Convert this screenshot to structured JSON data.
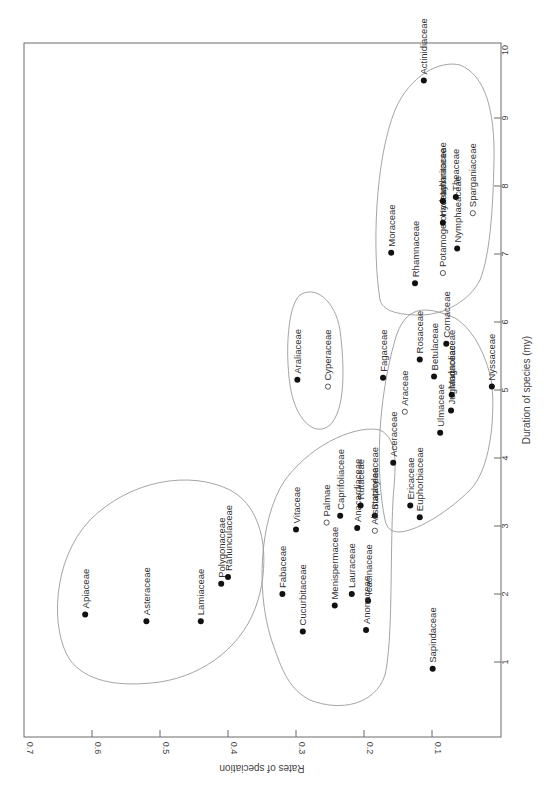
{
  "chart_data": {
    "type": "scatter",
    "orientation": "rotated-90-ccw",
    "title": "",
    "xlabel": "Duration of species (my)",
    "ylabel": "Rates of speciation",
    "xlim": [
      0,
      10
    ],
    "ylim": [
      0,
      0.7
    ],
    "x_ticks": [
      1,
      2,
      3,
      4,
      5,
      6,
      7,
      8,
      9,
      10
    ],
    "y_ticks": [
      "0.1",
      "0.2",
      "0.3",
      "0.4",
      "0.5",
      "0.6",
      "0.7"
    ],
    "grid": false,
    "legend": null,
    "marker_types": {
      "filled": "filled circle",
      "open": "open circle"
    },
    "clusters": [
      {
        "name": "cluster-1",
        "members": [
          "Apiaceae",
          "Asteraceae",
          "Lamiaceae",
          "Polygonaceae",
          "Ranunculaceae"
        ]
      },
      {
        "name": "cluster-2",
        "members": [
          "Vitaceae",
          "Fabaceae",
          "Cucurbitaceae",
          "Palmae",
          "Caprifoliaceae",
          "Menispermaceae",
          "Lauraceae",
          "Anacardiaceae",
          "Rutaceae",
          "Icacinaceae",
          "Anonaceae",
          "Staphyleaceae",
          "Alismataceae"
        ]
      },
      {
        "name": "cluster-3",
        "members": [
          "Araliaceae",
          "Cyperaceae"
        ]
      },
      {
        "name": "cluster-4",
        "members": [
          "Aceraceae",
          "Ericaceae",
          "Euphorbiaceae",
          "Fagaceae",
          "Araceae",
          "Rosaceae",
          "Ulmaceae",
          "Betulaceae",
          "Juglandaceae",
          "Magnoliaceae",
          "Cornaceae",
          "Nyssaceae"
        ]
      },
      {
        "name": "cluster-5",
        "members": [
          "Actinidiaceae",
          "Moraceae",
          "Rhamnaceae",
          "Potamogetonaceae",
          "Hydrocharitaceae",
          "Nymphaeaceae",
          "Lythraceae",
          "Theaceae",
          "Sparganiaceae"
        ]
      }
    ],
    "points": [
      {
        "label": "Apiaceae",
        "duration": 1.7,
        "rate": 0.61,
        "marker": "filled"
      },
      {
        "label": "Asteraceae",
        "duration": 1.6,
        "rate": 0.52,
        "marker": "filled"
      },
      {
        "label": "Lamiaceae",
        "duration": 1.6,
        "rate": 0.44,
        "marker": "filled"
      },
      {
        "label": "Polygonaceae",
        "duration": 2.15,
        "rate": 0.41,
        "marker": "filled"
      },
      {
        "label": "Ranunculaceae",
        "duration": 2.25,
        "rate": 0.4,
        "marker": "filled"
      },
      {
        "label": "Vitaceae",
        "duration": 2.95,
        "rate": 0.3,
        "marker": "filled"
      },
      {
        "label": "Fabaceae",
        "duration": 2.0,
        "rate": 0.32,
        "marker": "filled"
      },
      {
        "label": "Cucurbitaceae",
        "duration": 1.45,
        "rate": 0.29,
        "marker": "filled"
      },
      {
        "label": "Palmae",
        "duration": 3.05,
        "rate": 0.255,
        "marker": "open"
      },
      {
        "label": "Caprifoliaceae",
        "duration": 3.15,
        "rate": 0.235,
        "marker": "filled"
      },
      {
        "label": "Menispermaceae",
        "duration": 1.83,
        "rate": 0.243,
        "marker": "filled"
      },
      {
        "label": "Lauraceae",
        "duration": 2.0,
        "rate": 0.218,
        "marker": "filled"
      },
      {
        "label": "Anacardiaceae",
        "duration": 2.97,
        "rate": 0.21,
        "marker": "filled"
      },
      {
        "label": "Rutaceae",
        "duration": 3.3,
        "rate": 0.205,
        "marker": "filled"
      },
      {
        "label": "Icacinaceae",
        "duration": 1.9,
        "rate": 0.194,
        "marker": "filled"
      },
      {
        "label": "Anonaceae",
        "duration": 1.47,
        "rate": 0.197,
        "marker": "filled"
      },
      {
        "label": "Staphyleaceae",
        "duration": 3.15,
        "rate": 0.184,
        "marker": "filled"
      },
      {
        "label": "Alismataceae",
        "duration": 2.93,
        "rate": 0.184,
        "marker": "open"
      },
      {
        "label": "Araliaceae",
        "duration": 5.15,
        "rate": 0.298,
        "marker": "filled"
      },
      {
        "label": "Cyperaceae",
        "duration": 5.05,
        "rate": 0.253,
        "marker": "open"
      },
      {
        "label": "Aceraceae",
        "duration": 3.93,
        "rate": 0.157,
        "marker": "filled"
      },
      {
        "label": "Ericaceae",
        "duration": 3.3,
        "rate": 0.132,
        "marker": "filled"
      },
      {
        "label": "Euphorbiaceae",
        "duration": 3.13,
        "rate": 0.118,
        "marker": "filled"
      },
      {
        "label": "Fagaceae",
        "duration": 5.18,
        "rate": 0.172,
        "marker": "filled"
      },
      {
        "label": "Araceae",
        "duration": 4.68,
        "rate": 0.14,
        "marker": "open"
      },
      {
        "label": "Rosaceae",
        "duration": 5.45,
        "rate": 0.118,
        "marker": "filled"
      },
      {
        "label": "Ulmaceae",
        "duration": 4.37,
        "rate": 0.088,
        "marker": "filled"
      },
      {
        "label": "Betulaceae",
        "duration": 5.2,
        "rate": 0.097,
        "marker": "filled"
      },
      {
        "label": "Juglandaceae",
        "duration": 4.7,
        "rate": 0.072,
        "marker": "filled"
      },
      {
        "label": "Magnoliaceae",
        "duration": 4.93,
        "rate": 0.071,
        "marker": "filled"
      },
      {
        "label": "Cornaceae",
        "duration": 5.68,
        "rate": 0.079,
        "marker": "filled"
      },
      {
        "label": "Nyssaceae",
        "duration": 5.05,
        "rate": 0.012,
        "marker": "filled"
      },
      {
        "label": "Sapindaceae",
        "duration": 0.9,
        "rate": 0.099,
        "marker": "filled"
      },
      {
        "label": "Actinidiaceae",
        "duration": 9.55,
        "rate": 0.112,
        "marker": "filled"
      },
      {
        "label": "Moraceae",
        "duration": 7.02,
        "rate": 0.16,
        "marker": "filled"
      },
      {
        "label": "Rhamnaceae",
        "duration": 6.57,
        "rate": 0.125,
        "marker": "filled"
      },
      {
        "label": "Potamogetonaceae",
        "duration": 6.72,
        "rate": 0.084,
        "marker": "open"
      },
      {
        "label": "Hydrocharitaceae",
        "duration": 7.46,
        "rate": 0.084,
        "marker": "filled"
      },
      {
        "label": "Nymphaeaceae",
        "duration": 7.08,
        "rate": 0.063,
        "marker": "filled"
      },
      {
        "label": "Lythraceae",
        "duration": 7.78,
        "rate": 0.084,
        "marker": "filled"
      },
      {
        "label": "Theaceae",
        "duration": 7.84,
        "rate": 0.065,
        "marker": "filled"
      },
      {
        "label": "Sparganiaceae",
        "duration": 7.6,
        "rate": 0.04,
        "marker": "open"
      }
    ]
  }
}
